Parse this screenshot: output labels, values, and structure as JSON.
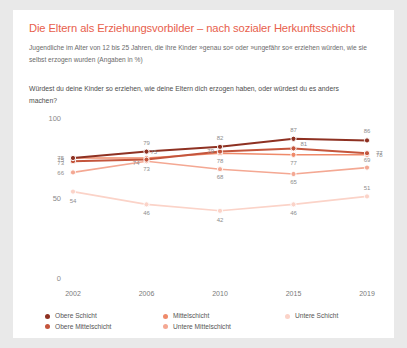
{
  "title": "Die Eltern als Erziehungsvorbilder – nach sozialer Herkunftsschicht",
  "subtitle": "Jugendliche im Alter von 12 bis 25 Jahren, die ihre Kinder »genau so« oder »ungefähr so« erziehen würden, wie sie selbst erzogen wurden (Angaben in %)",
  "question": "Würdest du deine Kinder so erziehen, wie deine Eltern dich erzogen haben, oder würdest du es anders machen?",
  "colors": {
    "title": "#e8604c",
    "obere_schicht": "#8e3122",
    "obere_mittelschicht": "#c4553c",
    "mittelschicht": "#ef8a6a",
    "untere_mittelschicht": "#f4a893",
    "untere_schicht": "#fbd3c8",
    "card_bg": "#ffffff",
    "page_bg": "#e9e9e9"
  },
  "chart_data": {
    "type": "line",
    "title": "Die Eltern als Erziehungsvorbilder – nach sozialer Herkunftsschicht",
    "xlabel": "",
    "ylabel": "",
    "ylim": [
      0,
      100
    ],
    "yticks": [
      "100",
      "50",
      "0"
    ],
    "ytick_values": [
      100,
      50,
      0
    ],
    "grid": false,
    "legend_position": "bottom",
    "categories": [
      "2002",
      "2006",
      "2010",
      "2015",
      "2019"
    ],
    "series": [
      {
        "name": "Obere Schicht",
        "color": "#8e3122",
        "values": [
          75,
          79,
          82,
          87,
          86
        ]
      },
      {
        "name": "Obere Mittelschicht",
        "color": "#c4553c",
        "values": [
          73,
          74,
          79,
          81,
          78
        ]
      },
      {
        "name": "Mittelschicht",
        "color": "#ef8a6a",
        "values": [
          75,
          75,
          78,
          77,
          77
        ]
      },
      {
        "name": "Untere Mittelschicht",
        "color": "#f4a893",
        "values": [
          66,
          73,
          68,
          65,
          69
        ]
      },
      {
        "name": "Untere Schicht",
        "color": "#fbd3c8",
        "values": [
          54,
          46,
          42,
          46,
          51
        ]
      }
    ]
  },
  "legend": [
    {
      "label": "Obere Schicht",
      "color": "#8e3122"
    },
    {
      "label": "Mittelschicht",
      "color": "#ef8a6a"
    },
    {
      "label": "Untere Schicht",
      "color": "#fbd3c8"
    },
    {
      "label": "Obere Mittelschicht",
      "color": "#c4553c"
    },
    {
      "label": "Untere Mittelschicht",
      "color": "#f4a893"
    }
  ]
}
